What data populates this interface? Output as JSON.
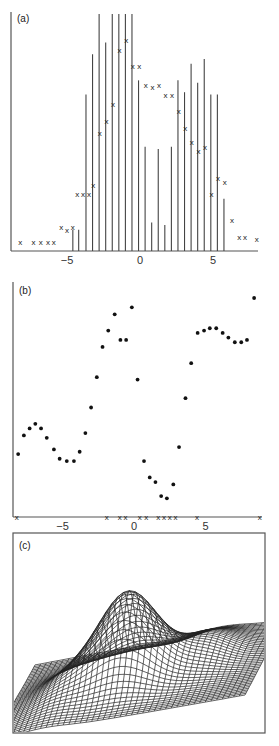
{
  "figure": {
    "panels": [
      {
        "id": "a",
        "label": "(a)"
      },
      {
        "id": "b",
        "label": "(b)"
      },
      {
        "id": "c",
        "label": "(c)"
      }
    ]
  },
  "chart_data": [
    {
      "panel": "(a)",
      "type": "bar",
      "title": "",
      "xlabel": "",
      "ylabel": "",
      "xlim": [
        -8.5,
        8.5
      ],
      "ylim": [
        0,
        1
      ],
      "grid": false,
      "x_ticks": [
        -5,
        0,
        5
      ],
      "x_tick_labels": [
        "−5",
        "0",
        "5"
      ],
      "series": [
        {
          "name": "bars",
          "style": "vertical lines",
          "x": [
            -4.6,
            -4.2,
            -3.7,
            -3.25,
            -2.8,
            -2.35,
            -1.9,
            -1.45,
            -1.0,
            -0.55,
            -0.1,
            0.35,
            0.8,
            1.25,
            1.7,
            2.15,
            2.6,
            3.05,
            3.5,
            3.95,
            4.4,
            4.85,
            5.3,
            5.75
          ],
          "values": [
            0.09,
            0.09,
            0.66,
            0.83,
            1.0,
            0.88,
            1.0,
            1.0,
            1.0,
            1.0,
            0.72,
            0.44,
            0.12,
            0.43,
            0.11,
            0.44,
            0.72,
            0.67,
            0.79,
            0.71,
            0.81,
            0.66,
            0.66,
            0.22
          ]
        },
        {
          "name": "x markers",
          "style": "x",
          "x": [
            -8.2,
            -7.3,
            -6.8,
            -6.3,
            -5.9,
            -5.4,
            -5.0,
            -4.6,
            -4.3,
            -3.9,
            -3.5,
            -3.2,
            -2.75,
            -2.3,
            -1.85,
            -1.4,
            -0.95,
            -0.5,
            -0.05,
            0.4,
            0.85,
            1.3,
            1.75,
            2.2,
            2.65,
            3.1,
            3.55,
            4.0,
            4.45,
            4.9,
            5.35,
            5.8,
            6.3,
            6.8,
            7.2,
            8.0
          ],
          "values": [
            0.04,
            0.04,
            0.04,
            0.04,
            0.04,
            0.1,
            0.09,
            0.1,
            0.24,
            0.24,
            0.24,
            0.28,
            0.5,
            0.55,
            0.62,
            0.85,
            0.89,
            0.78,
            0.78,
            0.7,
            0.69,
            0.7,
            0.66,
            0.66,
            0.59,
            0.52,
            0.46,
            0.42,
            0.44,
            0.24,
            0.31,
            0.29,
            0.13,
            0.06,
            0.06,
            0.05
          ]
        }
      ]
    },
    {
      "panel": "(b)",
      "type": "scatter",
      "title": "",
      "xlabel": "",
      "ylabel": "",
      "xlim": [
        -8.3,
        8.8
      ],
      "ylim": [
        0,
        1
      ],
      "grid": false,
      "x_ticks": [
        -5,
        0,
        5
      ],
      "x_tick_labels": [
        "−5",
        "0",
        "5"
      ],
      "series": [
        {
          "name": "points",
          "style": "dot",
          "x": [
            -8.1,
            -7.7,
            -7.3,
            -6.9,
            -6.5,
            -6.1,
            -5.6,
            -5.2,
            -4.7,
            -4.2,
            -3.8,
            -3.4,
            -3.0,
            -2.6,
            -2.2,
            -1.8,
            -1.35,
            -0.95,
            -0.55,
            -0.15,
            0.25,
            0.7,
            1.1,
            1.5,
            1.9,
            2.3,
            2.75,
            3.15,
            3.6,
            4.0,
            4.45,
            4.9,
            5.3,
            5.75,
            6.2,
            6.6,
            7.05,
            7.5,
            7.9,
            8.4
          ],
          "values": [
            0.27,
            0.35,
            0.38,
            0.4,
            0.38,
            0.34,
            0.29,
            0.25,
            0.24,
            0.24,
            0.28,
            0.36,
            0.47,
            0.6,
            0.73,
            0.8,
            0.87,
            0.76,
            0.76,
            0.9,
            0.59,
            0.24,
            0.17,
            0.15,
            0.09,
            0.08,
            0.14,
            0.3,
            0.51,
            0.66,
            0.79,
            0.8,
            0.81,
            0.81,
            0.79,
            0.77,
            0.75,
            0.75,
            0.76,
            0.94
          ]
        },
        {
          "name": "x markers on axis",
          "style": "x",
          "x": [
            -8.2,
            -1.9,
            -1.0,
            -0.6,
            0.4,
            0.85,
            1.7,
            2.1,
            2.5,
            2.9,
            4.4,
            8.8
          ],
          "values": [
            0,
            0,
            0,
            0,
            0,
            0,
            0,
            0,
            0,
            0,
            0,
            0
          ]
        }
      ]
    },
    {
      "panel": "(c)",
      "type": "surface",
      "title": "",
      "description": "3D wireframe mesh surface with a single central peak and smaller ridges, viewed in perspective inside a rectangular frame",
      "grid": false
    }
  ]
}
